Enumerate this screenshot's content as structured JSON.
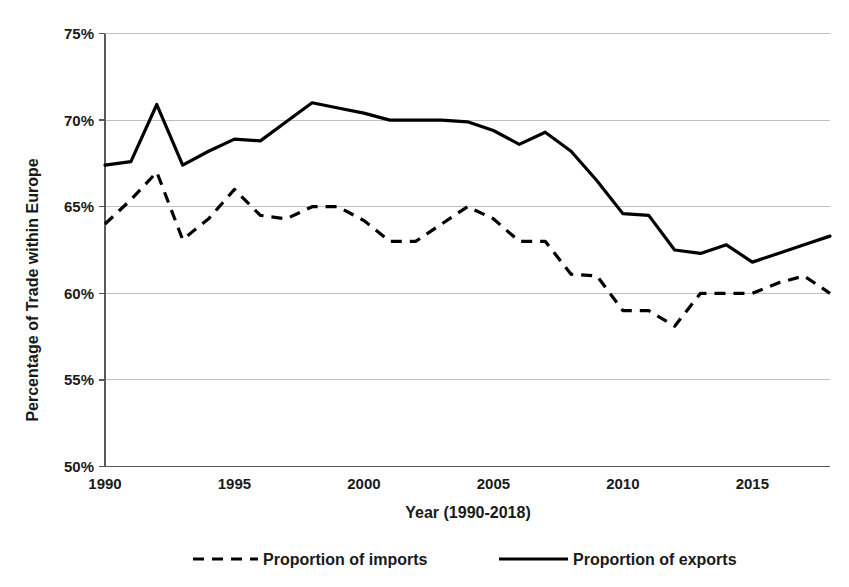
{
  "chart_data": {
    "type": "line",
    "title": "",
    "xlabel": "Year (1990-2018)",
    "ylabel": "Percentage of Trade within Europe",
    "x": [
      1990,
      1991,
      1992,
      1993,
      1994,
      1995,
      1996,
      1997,
      1998,
      1999,
      2000,
      2001,
      2002,
      2003,
      2004,
      2005,
      2006,
      2007,
      2008,
      2009,
      2010,
      2011,
      2012,
      2013,
      2014,
      2015,
      2016,
      2017,
      2018
    ],
    "xlim": [
      1990,
      2018
    ],
    "ylim": [
      50,
      75
    ],
    "yticks": [
      "50%",
      "55%",
      "60%",
      "65%",
      "70%",
      "75%"
    ],
    "xticks": [
      "1990",
      "1995",
      "2000",
      "2005",
      "2010",
      "2015"
    ],
    "ytick_values": [
      50,
      55,
      60,
      65,
      70,
      75
    ],
    "xtick_values": [
      1990,
      1995,
      2000,
      2005,
      2010,
      2015
    ],
    "ytick_suffix": "%",
    "grid": true,
    "legend_position": "bottom",
    "series": [
      {
        "name": "Proportion of imports",
        "style": "dashed",
        "color": "#000000",
        "values": [
          64.0,
          65.4,
          67.0,
          63.1,
          64.3,
          66.0,
          64.5,
          64.3,
          65.0,
          65.0,
          64.2,
          63.0,
          63.0,
          64.0,
          65.0,
          64.3,
          63.0,
          63.0,
          61.1,
          61.0,
          59.0,
          59.0,
          58.1,
          60.0,
          60.0,
          60.0,
          60.6,
          61.0,
          60.0
        ]
      },
      {
        "name": "Proportion of exports",
        "style": "solid",
        "color": "#000000",
        "values": [
          67.4,
          67.6,
          70.9,
          67.4,
          68.2,
          68.9,
          68.8,
          69.9,
          71.0,
          70.7,
          70.4,
          70.0,
          70.0,
          70.0,
          69.9,
          69.4,
          68.6,
          69.3,
          68.2,
          66.5,
          64.6,
          64.5,
          62.5,
          62.3,
          62.8,
          61.8,
          62.3,
          62.8,
          63.3
        ]
      }
    ]
  },
  "legend": {
    "items": [
      {
        "label": "Proportion of imports",
        "style": "dashed"
      },
      {
        "label": "Proportion of exports",
        "style": "solid"
      }
    ]
  },
  "axes": {
    "x_title": "Year (1990-2018)",
    "y_title": "Percentage of Trade within Europe"
  }
}
